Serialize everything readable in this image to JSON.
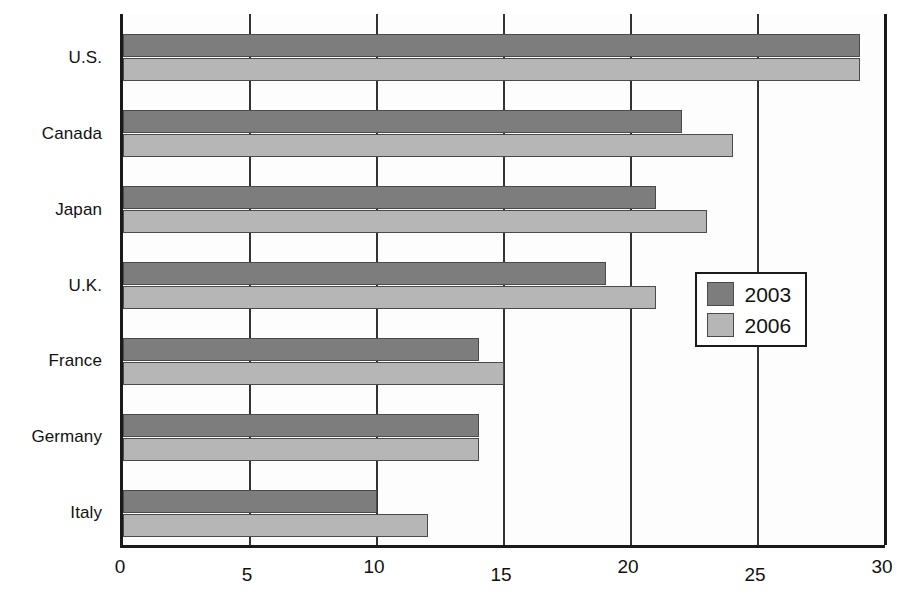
{
  "chart_data": {
    "type": "bar",
    "orientation": "horizontal",
    "title": "",
    "subtitle": "",
    "xlabel": "",
    "ylabel": "",
    "categories": [
      "U.S.",
      "Canada",
      "Japan",
      "U.K.",
      "France",
      "Germany",
      "Italy"
    ],
    "series": [
      {
        "name": "2003",
        "color": "#7d7d7d",
        "values": [
          29,
          22,
          21,
          19,
          14,
          14,
          10
        ]
      },
      {
        "name": "2006",
        "color": "#b6b6b6",
        "values": [
          29,
          24,
          23,
          21,
          15,
          14,
          12
        ]
      }
    ],
    "xlim": [
      0,
      30
    ],
    "xticks": [
      0,
      5,
      10,
      15,
      20,
      25,
      30
    ],
    "xtick_labels": [
      "0",
      "5",
      "10",
      "15",
      "20",
      "25",
      "30"
    ],
    "grid": true,
    "grid_axis": "x",
    "legend": {
      "position": "center-right",
      "entries": [
        "2003",
        "2006"
      ]
    }
  }
}
